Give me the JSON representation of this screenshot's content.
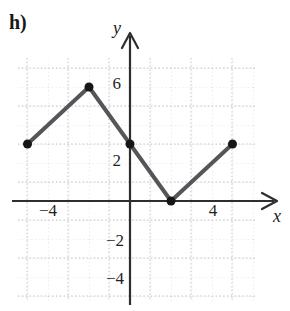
{
  "figure": {
    "part_label": "h)",
    "background_color": "#ffffff"
  },
  "axes": {
    "x_axis_label": "x",
    "y_axis_label": "y",
    "axis_color": "#2a2a2a",
    "grid_color": "#c8c4cc",
    "x_tick_labels": [
      "−4",
      "4"
    ],
    "y_tick_labels": [
      "6",
      "2",
      "−2",
      "−4"
    ]
  },
  "chart_data": {
    "type": "line",
    "title": "",
    "subtitle": "",
    "xlabel": "x",
    "ylabel": "y",
    "xlim": [
      -5.5,
      6.1
    ],
    "ylim": [
      -5.2,
      7.4
    ],
    "grid": true,
    "grid_style": "dotted",
    "grid_step": 1,
    "legend": "none",
    "series": [
      {
        "name": "piecewise-linear",
        "line_color": "#55555a",
        "line_width": 4,
        "marker": "filled-circle",
        "marker_color": "#161616",
        "marker_size": 9,
        "x": [
          -5,
          -2,
          0,
          2,
          5
        ],
        "y": [
          3,
          6,
          3,
          0,
          3
        ],
        "points": [
          {
            "x": -5,
            "y": 3,
            "marker": true
          },
          {
            "x": -2,
            "y": 6,
            "marker": true
          },
          {
            "x": 0,
            "y": 3,
            "marker": true
          },
          {
            "x": 2,
            "y": 0,
            "marker": true
          },
          {
            "x": 5,
            "y": 3,
            "marker": true
          }
        ]
      }
    ],
    "x_ticks": [
      -4,
      4
    ],
    "y_ticks": [
      6,
      2,
      -2,
      -4
    ],
    "annotations": [
      {
        "text": "h)",
        "position": "top-left"
      }
    ]
  }
}
